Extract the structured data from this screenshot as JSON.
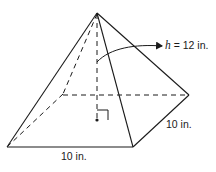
{
  "figure": {
    "labels": {
      "height_var": "h",
      "height_rest": " = 12 in.",
      "front_base_edge": "10 in.",
      "right_base_edge": "10 in."
    },
    "dimensions": {
      "height_in": 12,
      "base_length_in": 10,
      "base_width_in": 10
    },
    "colors": {
      "stroke": "#1a1a1a",
      "background": "#ffffff"
    }
  }
}
